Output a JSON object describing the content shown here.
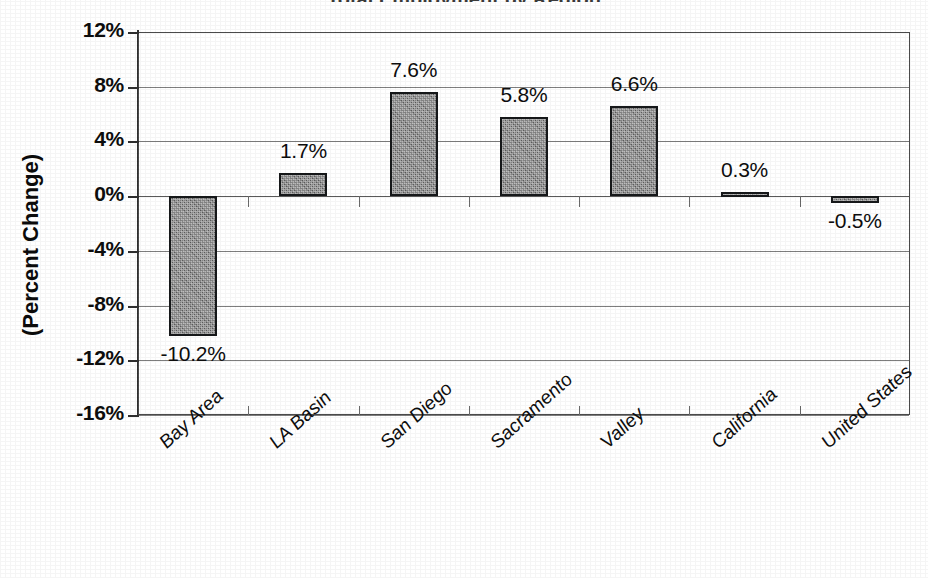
{
  "chart_data": {
    "type": "bar",
    "title": "Total Employment by Region",
    "title_clipped": true,
    "xlabel": "",
    "ylabel": "(Percent Change)",
    "ylim": [
      -16,
      12
    ],
    "ytick_step": 4,
    "grid": true,
    "legend": "none",
    "orientation": "vertical",
    "categories": [
      "Bay Area",
      "LA Basin",
      "San Diego",
      "Sacramento",
      "Valley",
      "California",
      "United States"
    ],
    "values": [
      -10.2,
      1.7,
      7.6,
      5.8,
      6.6,
      0.3,
      -0.5
    ],
    "value_labels": [
      "-10.2%",
      "1.7%",
      "7.6%",
      "5.8%",
      "6.6%",
      "0.3%",
      "-0.5%"
    ],
    "ytick_labels": [
      "12%",
      "8%",
      "4%",
      "0%",
      "-4%",
      "-8%",
      "-12%",
      "-16%"
    ],
    "ytick_values": [
      12,
      8,
      4,
      0,
      -4,
      -8,
      -12,
      -16
    ],
    "units": "percent",
    "bar_fill_color": "#737373",
    "bar_border_color": "#16181a",
    "gridline_color": "#7d7d7d",
    "axis_color": "#2f2f2f",
    "text_color": "#0d0d0d"
  }
}
